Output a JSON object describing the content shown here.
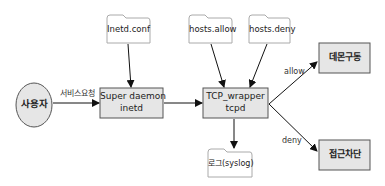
{
  "diagram": {
    "nodes": {
      "user": {
        "label": "사용자",
        "shape": "ellipse"
      },
      "super_daemon": {
        "line1": "Super daemon",
        "line2": "inetd",
        "shape": "box"
      },
      "tcp_wrapper": {
        "line1": "TCP_wrapper",
        "line2": "tcpd",
        "shape": "box"
      },
      "daemon_start": {
        "label": "데몬구동",
        "shape": "box"
      },
      "access_block": {
        "label": "접근차단",
        "shape": "box"
      },
      "inetd_conf": {
        "label": "Inetd.conf",
        "shape": "document"
      },
      "hosts_allow": {
        "label": "hosts.allow",
        "shape": "document"
      },
      "hosts_deny": {
        "label": "hosts.deny",
        "shape": "document"
      },
      "syslog": {
        "label": "로그(syslog)",
        "shape": "document"
      }
    },
    "edges": {
      "user_to_super": {
        "label": "서비스요청"
      },
      "tcp_to_daemon": {
        "label": "allow"
      },
      "tcp_to_block": {
        "label": "deny"
      }
    },
    "colors": {
      "box_fill": "#e6e6e6",
      "box_stroke": "#555555",
      "doc_fill": "#ffffff",
      "doc_stroke": "#aaaaaa",
      "arrow": "#111111"
    }
  }
}
